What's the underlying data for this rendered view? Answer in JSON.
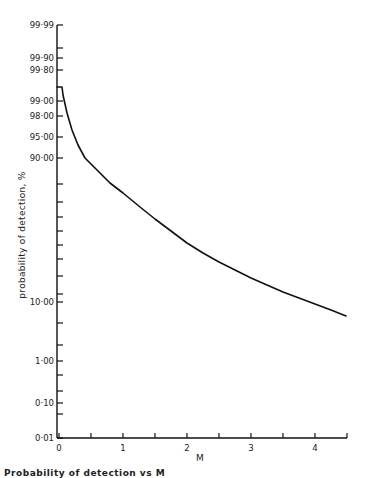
{
  "chart_data": {
    "type": "line",
    "title": "",
    "xlabel": "M",
    "ylabel": "probability of detection, %",
    "y_scale": "probability (normal quantile)",
    "xlim": [
      0,
      4.5
    ],
    "ylim": [
      0.01,
      99.99
    ],
    "grid": false,
    "x_ticks": [
      0,
      0.5,
      1,
      1.5,
      2,
      2.5,
      3,
      3.5,
      4,
      4.5
    ],
    "x_tick_labels": [
      "0",
      "",
      "1",
      "",
      "2",
      "",
      "3",
      "",
      "4",
      ""
    ],
    "y_tick_labels": [
      "99·99",
      "99·90",
      "99·80",
      "99·00",
      "98·00",
      "95·00",
      "90·00",
      "10·00",
      "1·00",
      "0·10",
      "0·01"
    ],
    "series": [
      {
        "name": "probability of detection",
        "x": [
          0,
          0.08,
          0.25,
          0.5,
          1.0,
          1.5,
          2.0,
          2.5,
          3.0,
          3.5,
          4.0,
          4.5
        ],
        "y": [
          99.6,
          99.5,
          97.5,
          90.0,
          68.0,
          50.0,
          35.0,
          24.0,
          17.0,
          12.5,
          9.5,
          7.0
        ]
      }
    ]
  },
  "axes": {
    "y_title": "probability of detection, %",
    "x_title": "M",
    "y_ticks": [
      {
        "label": "99·99",
        "py": 25
      },
      {
        "label": "",
        "py": 48
      },
      {
        "label": "99·90",
        "py": 58
      },
      {
        "label": "99·80",
        "py": 70
      },
      {
        "label": "99·00",
        "py": 101
      },
      {
        "label": "98·00",
        "py": 116
      },
      {
        "label": "95·00",
        "py": 137
      },
      {
        "label": "90·00",
        "py": 158
      },
      {
        "label": "",
        "py": 184
      },
      {
        "label": "",
        "py": 202
      },
      {
        "label": "",
        "py": 217
      },
      {
        "label": "",
        "py": 231
      },
      {
        "label": "",
        "py": 245
      },
      {
        "label": "",
        "py": 259
      },
      {
        "label": "",
        "py": 276
      },
      {
        "label": "",
        "py": 294
      },
      {
        "label": "10·00",
        "py": 302
      },
      {
        "label": "",
        "py": 323
      },
      {
        "label": "",
        "py": 345
      },
      {
        "label": "1·00",
        "py": 361
      },
      {
        "label": "",
        "py": 375
      },
      {
        "label": "",
        "py": 391
      },
      {
        "label": "0·10",
        "py": 403
      },
      {
        "label": "",
        "py": 414
      },
      {
        "label": "0·01",
        "py": 438
      }
    ],
    "x_ticks": [
      {
        "label": "0",
        "px": 59
      },
      {
        "label": "",
        "px": 91
      },
      {
        "label": "1",
        "px": 123
      },
      {
        "label": "",
        "px": 155
      },
      {
        "label": "2",
        "px": 187
      },
      {
        "label": "",
        "px": 219
      },
      {
        "label": "3",
        "px": 251
      },
      {
        "label": "",
        "px": 283
      },
      {
        "label": "4",
        "px": 315
      },
      {
        "label": "",
        "px": 347
      }
    ],
    "curve_pixels": [
      [
        57,
        87
      ],
      [
        62,
        87
      ],
      [
        63,
        95
      ],
      [
        67,
        113
      ],
      [
        72,
        130
      ],
      [
        78,
        145
      ],
      [
        85,
        158
      ],
      [
        97,
        170
      ],
      [
        110,
        183
      ],
      [
        123,
        193
      ],
      [
        140,
        207
      ],
      [
        155,
        219
      ],
      [
        171,
        231
      ],
      [
        187,
        243
      ],
      [
        203,
        253
      ],
      [
        219,
        262
      ],
      [
        235,
        270
      ],
      [
        251,
        278
      ],
      [
        267,
        285
      ],
      [
        283,
        292
      ],
      [
        299,
        298
      ],
      [
        315,
        304
      ],
      [
        331,
        310
      ],
      [
        346,
        316
      ]
    ]
  },
  "caption": {
    "text": "Probability of detection vs M"
  }
}
